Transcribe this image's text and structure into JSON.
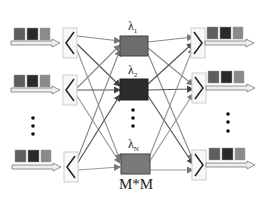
{
  "diagram": {
    "type": "optical switch fabric (wavelength routing)",
    "inputs": [
      {
        "id": "in-1",
        "packet_colors": [
          "#5e5e5e",
          "#2a2a2a",
          "#8a8a8a"
        ]
      },
      {
        "id": "in-2",
        "packet_colors": [
          "#5e5e5e",
          "#2a2a2a",
          "#8a8a8a"
        ]
      },
      {
        "id": "in-ellipsis",
        "ellipsis": "⋮"
      },
      {
        "id": "in-N",
        "packet_colors": [
          "#5e5e5e",
          "#2a2a2a",
          "#8a8a8a"
        ]
      }
    ],
    "switches": [
      {
        "label": "λ",
        "subscript": "1",
        "fill": "#6e6e6e"
      },
      {
        "label": "λ",
        "subscript": "2",
        "fill": "#2b2b2b"
      },
      {
        "label": "λ",
        "subscript": "N",
        "fill": "#7a7a7a"
      }
    ],
    "switch_size_label": "M*M",
    "outputs": [
      {
        "id": "out-1",
        "packet_colors": [
          "#5e5e5e",
          "#2a2a2a",
          "#8a8a8a"
        ]
      },
      {
        "id": "out-2",
        "packet_colors": [
          "#5e5e5e",
          "#2a2a2a",
          "#8a8a8a"
        ]
      },
      {
        "id": "out-ellipsis",
        "ellipsis": "⋮"
      },
      {
        "id": "out-N",
        "packet_colors": [
          "#5e5e5e",
          "#2a2a2a",
          "#8a8a8a"
        ]
      }
    ],
    "colors": {
      "line_light": "#9a9a9a",
      "line_dark": "#555555",
      "frame": "#cfcfcf"
    }
  }
}
